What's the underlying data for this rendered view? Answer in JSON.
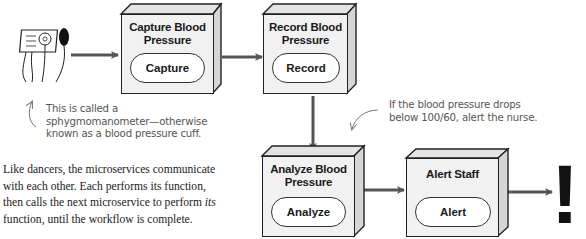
{
  "diagram": {
    "type": "microservice-choreography-flow",
    "nodes": [
      {
        "id": "capture",
        "title": "Capture Blood Pressure",
        "title_line1": "Capture Blood",
        "title_line2": "Pressure",
        "action": "Capture"
      },
      {
        "id": "record",
        "title": "Record Blood Pressure",
        "title_line1": "Record Blood",
        "title_line2": "Pressure",
        "action": "Record"
      },
      {
        "id": "analyze",
        "title": "Analyze Blood Pressure",
        "title_line1": "Analyze Blood",
        "title_line2": "Pressure",
        "action": "Analyze"
      },
      {
        "id": "alert",
        "title": "Alert Staff",
        "title_line1": "Alert Staff",
        "title_line2": "",
        "action": "Alert"
      }
    ],
    "edges": [
      {
        "from": "sphygmomanometer",
        "to": "capture"
      },
      {
        "from": "capture",
        "to": "record"
      },
      {
        "from": "record",
        "to": "analyze"
      },
      {
        "from": "analyze",
        "to": "alert"
      },
      {
        "from": "alert",
        "to": "exclamation"
      }
    ],
    "device_icon": "sphygmomanometer-icon",
    "end_symbol": "!"
  },
  "annotations": {
    "device_note": {
      "line1": "This is called a",
      "line2": "sphygmomanometer—otherwise",
      "line3": "known as a blood pressure cuff."
    },
    "threshold_note": {
      "line1": "If the blood pressure drops",
      "line2": "below 100/60, alert the nurse."
    }
  },
  "caption": {
    "line1": "Like dancers, the microservices communicate",
    "line2": "with each other. Each performs its function,",
    "line3_pre": "then calls the next microservice to perform ",
    "line3_em": "its",
    "line4": "function, until the workflow is complete."
  },
  "colors": {
    "box_face": "#f1f1f1",
    "box_side": "#d6d6d6",
    "stroke": "#222222",
    "arrow": "#555555",
    "note_text": "#555555"
  }
}
